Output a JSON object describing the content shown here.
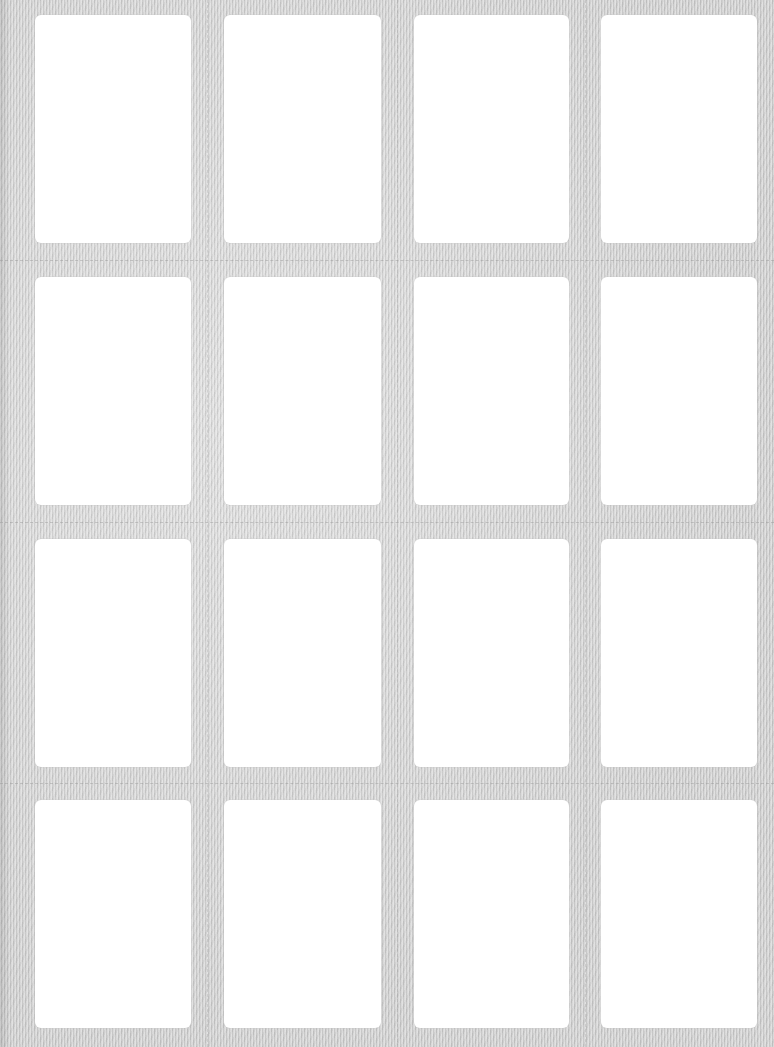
{
  "sheet": {
    "type": "label-sheet",
    "rows": 4,
    "columns": 4,
    "background_color": "#d6d6d6",
    "label_color": "#ffffff",
    "labels": [
      {
        "row": 1,
        "col": 1,
        "text": ""
      },
      {
        "row": 1,
        "col": 2,
        "text": ""
      },
      {
        "row": 1,
        "col": 3,
        "text": ""
      },
      {
        "row": 1,
        "col": 4,
        "text": ""
      },
      {
        "row": 2,
        "col": 1,
        "text": ""
      },
      {
        "row": 2,
        "col": 2,
        "text": ""
      },
      {
        "row": 2,
        "col": 3,
        "text": ""
      },
      {
        "row": 2,
        "col": 4,
        "text": ""
      },
      {
        "row": 3,
        "col": 1,
        "text": ""
      },
      {
        "row": 3,
        "col": 2,
        "text": ""
      },
      {
        "row": 3,
        "col": 3,
        "text": ""
      },
      {
        "row": 3,
        "col": 4,
        "text": ""
      },
      {
        "row": 4,
        "col": 1,
        "text": ""
      },
      {
        "row": 4,
        "col": 2,
        "text": ""
      },
      {
        "row": 4,
        "col": 3,
        "text": ""
      },
      {
        "row": 4,
        "col": 4,
        "text": ""
      }
    ]
  }
}
